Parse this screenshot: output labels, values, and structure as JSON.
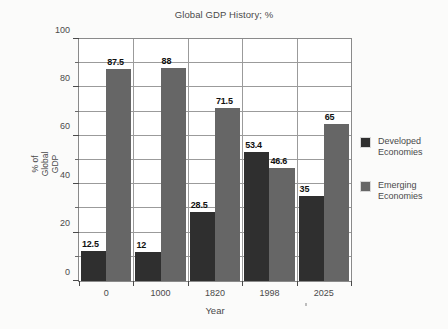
{
  "chart_data": {
    "type": "bar",
    "title": "Global GDP History; %",
    "xlabel": "Year",
    "ylabel": "% of\nGlobal\nGDP",
    "categories": [
      "0",
      "1000",
      "1820",
      "1998",
      "2025"
    ],
    "series": [
      {
        "name": "Developed\nEconomies",
        "color": "#2f2f2f",
        "values": [
          12.5,
          12,
          28.5,
          53.4,
          35
        ],
        "labels": [
          "12.5",
          "12",
          "28.5",
          "53.4",
          "35"
        ]
      },
      {
        "name": "Emerging\nEconomies",
        "color": "#666666",
        "values": [
          87.5,
          88,
          71.5,
          46.6,
          65
        ],
        "labels": [
          "87.5",
          "88",
          "71.5",
          "46.6",
          "65"
        ]
      }
    ],
    "ylim": [
      0,
      100
    ],
    "yticks": [
      0,
      20,
      40,
      60,
      80,
      100
    ],
    "ytick_labels": [
      "0",
      "20",
      "40",
      "60",
      "80",
      "100"
    ],
    "yminor_ticks": [
      10,
      30,
      50,
      70,
      90
    ],
    "grid": true,
    "grid_axis": "both",
    "legend_position": "right",
    "plot_background": "#ffffff",
    "figure_background": "#fbfbfa",
    "axis_color": "#8a8a8a"
  }
}
